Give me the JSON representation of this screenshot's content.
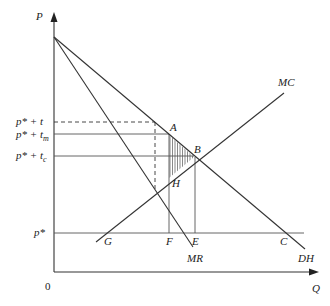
{
  "diagram": {
    "type": "economics-supply-demand",
    "axes": {
      "y_label": "P",
      "x_label": "Q",
      "origin_label": "0"
    },
    "price_levels": [
      {
        "id": "p_star_plus_t",
        "base": "p* + t",
        "subscript": "",
        "style": "dashed"
      },
      {
        "id": "p_star_plus_tm",
        "base": "p* + t",
        "subscript": "m",
        "style": "solid"
      },
      {
        "id": "p_star_plus_tc",
        "base": "p* + t",
        "subscript": "c",
        "style": "solid"
      },
      {
        "id": "p_star",
        "base": "p*",
        "subscript": "",
        "style": "solid"
      }
    ],
    "curves": [
      {
        "id": "DH",
        "label": "DH",
        "kind": "demand"
      },
      {
        "id": "MR",
        "label": "MR",
        "kind": "marginal-revenue"
      },
      {
        "id": "MC",
        "label": "MC",
        "kind": "marginal-cost"
      }
    ],
    "points": [
      {
        "label": "A"
      },
      {
        "label": "B"
      },
      {
        "label": "H"
      },
      {
        "label": "G"
      },
      {
        "label": "F"
      },
      {
        "label": "E"
      },
      {
        "label": "C"
      }
    ],
    "shaded_region": {
      "vertices": [
        "A",
        "B",
        "H"
      ],
      "pattern": "vertical-hatch"
    }
  }
}
